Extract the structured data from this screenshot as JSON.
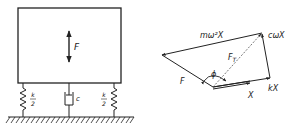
{
  "left_figure": {
    "force_label": "F",
    "spring_left_label": {
      "num": "k",
      "den": "2"
    },
    "spring_right_label": {
      "num": "k",
      "den": "2"
    },
    "damper_label": "c"
  },
  "right_figure": {
    "vectors": {
      "displacement": "X",
      "spring_force": "kX",
      "damping_force": "cωX",
      "inertia_force": "mω²X",
      "applied_force": "F",
      "transmitted_force": "F",
      "transmitted_force_sub": "T"
    },
    "angle_label": "ϕ"
  },
  "colors": {
    "ink": "#222222",
    "background": "#ffffff"
  }
}
